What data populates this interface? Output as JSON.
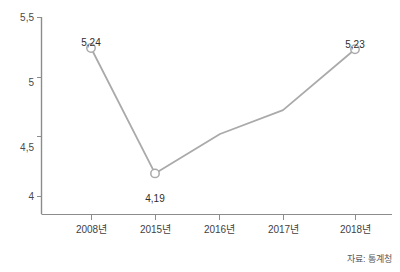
{
  "chart_data": {
    "type": "line",
    "title": "",
    "xlabel": "",
    "ylabel": "",
    "categories": [
      "2008년",
      "2015년",
      "2016년",
      "2017년",
      "2018년"
    ],
    "values": [
      5.24,
      4.19,
      4.52,
      4.72,
      5.23
    ],
    "point_labels": [
      "5,24",
      "4,19",
      "",
      "",
      "5,23"
    ],
    "point_label_positions": [
      "above",
      "below",
      "none",
      "none",
      "above"
    ],
    "markers": [
      true,
      true,
      false,
      false,
      true
    ],
    "ylim": [
      3.85,
      5.5
    ],
    "yticks": [
      4,
      4.5,
      5,
      5.5
    ],
    "ytick_labels": [
      "4",
      "4,5",
      "5",
      "5,5"
    ],
    "grid": false,
    "legend": null,
    "series_color": "#aaaaaa",
    "axis_color": "#8c8c8c",
    "marker_fill": "#ffffff"
  },
  "source": {
    "text": "자료: 통계청"
  },
  "axis": {
    "y_axis_name": "value-axis",
    "x_axis_name": "year-axis"
  }
}
